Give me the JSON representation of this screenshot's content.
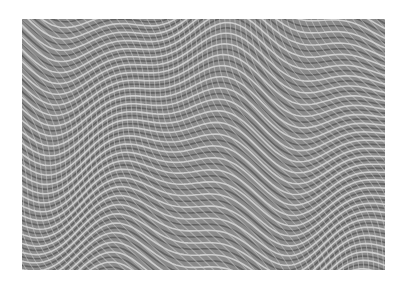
{
  "image": {
    "description": "Abstract grayscale op-art pattern of interlocking wavy curved lines forming a moiré texture",
    "colors": {
      "background": "#ffffff",
      "base": "#8a8a8a",
      "light_line": "#d8d8d8",
      "dark_line": "#5a5a5a"
    },
    "frame": {
      "x": 22,
      "y": 19,
      "width": 363,
      "height": 251
    }
  }
}
